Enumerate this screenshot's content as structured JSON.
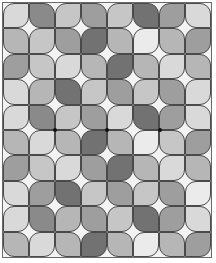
{
  "pattern": {
    "columns": 8,
    "rows": 10,
    "background_color": "#f3f3f3",
    "outline_color": "#4a4a4a",
    "shades": {
      "vl": "#ebebeb",
      "l": "#d9d9d9",
      "lm": "#c6c6c6",
      "ml": "#b6b6b6",
      "m": "#9e9e9e",
      "md": "#8a8a8a",
      "d": "#727272"
    },
    "grid": [
      [
        "l",
        "md",
        "lm",
        "m",
        "lm",
        "d",
        "m",
        "l"
      ],
      [
        "ml",
        "lm",
        "m",
        "d",
        "ml",
        "vl",
        "ml",
        "m"
      ],
      [
        "m",
        "lm",
        "l",
        "ml",
        "d",
        "ml",
        "l",
        "ml"
      ],
      [
        "l",
        "ml",
        "d",
        "lm",
        "m",
        "lm",
        "m",
        "l"
      ],
      [
        "l",
        "md",
        "lm",
        "m",
        "l",
        "d",
        "m",
        "l"
      ],
      [
        "ml",
        "l",
        "ml",
        "d",
        "ml",
        "vl",
        "lm",
        "m"
      ],
      [
        "m",
        "lm",
        "l",
        "m",
        "d",
        "ml",
        "l",
        "ml"
      ],
      [
        "l",
        "m",
        "d",
        "lm",
        "m",
        "lm",
        "m",
        "vl"
      ],
      [
        "l",
        "md",
        "ml",
        "m",
        "lm",
        "d",
        "m",
        "l"
      ],
      [
        "ml",
        "l",
        "ml",
        "d",
        "ml",
        "vl",
        "ml",
        "m"
      ]
    ],
    "dots": [
      {
        "col": 2,
        "row": 5
      },
      {
        "col": 4,
        "row": 5
      },
      {
        "col": 6,
        "row": 5
      }
    ]
  }
}
